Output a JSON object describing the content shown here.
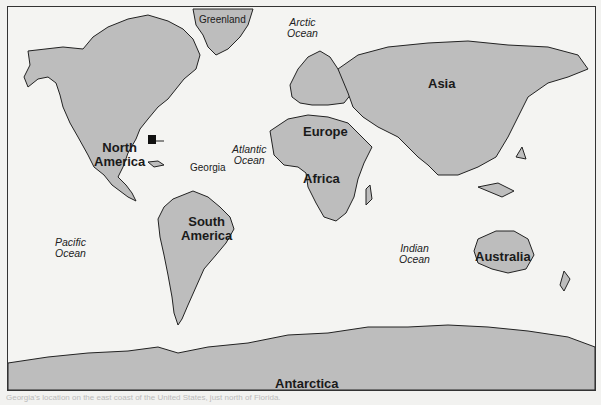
{
  "map": {
    "continents": [
      {
        "name": "North America",
        "line1": "North",
        "line2": "America"
      },
      {
        "name": "South America",
        "line1": "South",
        "line2": "America"
      },
      {
        "name": "Europe"
      },
      {
        "name": "Asia"
      },
      {
        "name": "Africa"
      },
      {
        "name": "Australia"
      },
      {
        "name": "Antarctica"
      }
    ],
    "oceans": [
      {
        "name": "Arctic Ocean",
        "line1": "Arctic",
        "line2": "Ocean"
      },
      {
        "name": "Atlantic Ocean",
        "line1": "Atlantic",
        "line2": "Ocean"
      },
      {
        "name": "Pacific Ocean",
        "line1": "Pacific",
        "line2": "Ocean"
      },
      {
        "name": "Indian Ocean",
        "line1": "Indian",
        "line2": "Ocean"
      }
    ],
    "other_labels": {
      "greenland": "Greenland",
      "georgia": "Georgia"
    },
    "colors": {
      "land": "#bdbdbd",
      "water": "#f4f4f2",
      "highlight": "#111111"
    }
  },
  "caption": "Georgia's location on the east coast of the United States, just north of Florida."
}
